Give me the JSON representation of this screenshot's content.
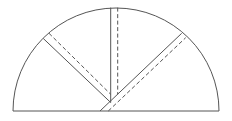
{
  "diagram": {
    "type": "geometry-figure",
    "stroke_color": "#555555",
    "background": "#ffffff",
    "semicircle": {
      "cx": 116,
      "cy": 111,
      "r": 103
    },
    "baseline": {
      "x1": 13,
      "y1": 111,
      "x2": 219,
      "y2": 111
    },
    "solid_lines": [
      {
        "name": "vertical-solid",
        "x1": 110.7,
        "y1": 7.6,
        "x2": 110.7,
        "y2": 102.5
      },
      {
        "name": "left-diagonal-solid",
        "x1": 43.3,
        "y1": 38.5,
        "x2": 110.7,
        "y2": 102.5
      },
      {
        "name": "right-diagonal-solid",
        "x1": 100,
        "y1": 111,
        "x2": 181.7,
        "y2": 33.3
      }
    ],
    "dashed_lines": [
      {
        "name": "vertical-dashed",
        "x1": 117.7,
        "y1": 7.6,
        "x2": 117.7,
        "y2": 94.3
      },
      {
        "name": "left-diagonal-dashed",
        "x1": 49,
        "y1": 33.3,
        "x2": 110.7,
        "y2": 94.3
      },
      {
        "name": "right-diagonal-dashed",
        "x1": 108.3,
        "y1": 111,
        "x2": 185.7,
        "y2": 37.7
      }
    ]
  }
}
